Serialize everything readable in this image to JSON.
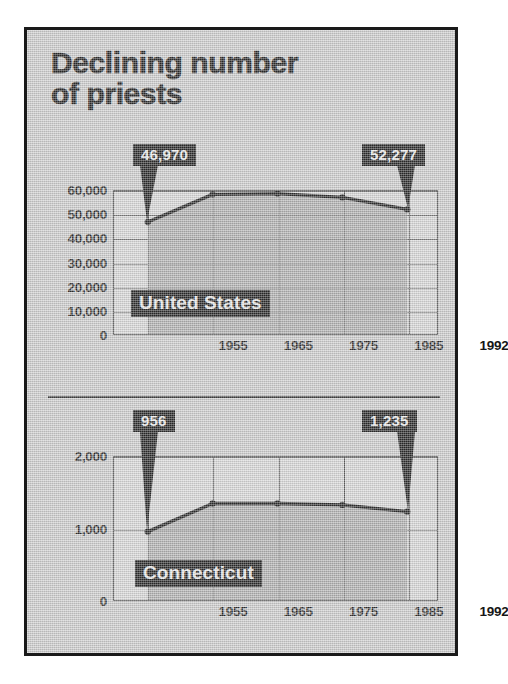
{
  "headline": {
    "line1": "Declining number",
    "line2": "of priests"
  },
  "colors": {
    "paper": "#c9c9c9",
    "frame": "#1a1a1a",
    "plot_bg": "#d4d4d4",
    "area_fill": "#9a9a9a",
    "line": "#151515",
    "plate_bg": "#111111",
    "plate_text": "#e9e9e9"
  },
  "chart_data": [
    {
      "type": "line",
      "title": "United States",
      "series_label": "United States",
      "xlabel": "",
      "ylabel": "",
      "categories": [
        "1955",
        "1965",
        "1975",
        "1985",
        "1992"
      ],
      "x": [
        1955,
        1965,
        1975,
        1985,
        1992
      ],
      "values": [
        46970,
        58600,
        58900,
        57300,
        52277
      ],
      "ylim": [
        0,
        60000
      ],
      "yticks": [
        0,
        10000,
        20000,
        30000,
        40000,
        50000,
        60000
      ],
      "ytick_labels": [
        "0",
        "10,000",
        "20,000",
        "30,000",
        "40,000",
        "50,000",
        "60,000"
      ],
      "grid": true,
      "legend": "none",
      "annotations": [
        {
          "label": "46,970",
          "point_index": 0,
          "value": 46970
        },
        {
          "label": "52,277",
          "point_index": 4,
          "value": 52277
        }
      ]
    },
    {
      "type": "line",
      "title": "Connecticut",
      "series_label": "Connecticut",
      "xlabel": "",
      "ylabel": "",
      "categories": [
        "1955",
        "1965",
        "1975",
        "1985",
        "1992"
      ],
      "x": [
        1955,
        1965,
        1975,
        1985,
        1992
      ],
      "values": [
        956,
        1350,
        1350,
        1330,
        1235
      ],
      "ylim": [
        0,
        2000
      ],
      "yticks": [
        0,
        1000,
        2000
      ],
      "ytick_labels": [
        "0",
        "1,000",
        "2,000"
      ],
      "grid": true,
      "legend": "none",
      "annotations": [
        {
          "label": "956",
          "point_index": 0,
          "value": 956
        },
        {
          "label": "1,235",
          "point_index": 4,
          "value": 1235
        }
      ]
    }
  ]
}
